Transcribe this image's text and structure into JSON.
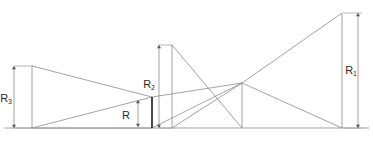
{
  "figure": {
    "kind": "technical-line-diagram",
    "background_color": "#ffffff",
    "line_color": "#8c8c8c",
    "accent_color": "#1a1a1a",
    "dimension_color": "#7d7d7d",
    "text_color": "#2b2b2b",
    "width": 373,
    "height": 141
  },
  "baseline": {
    "label": "baseline",
    "x1": 4,
    "y1": 128,
    "x2": 369,
    "y2": 128
  },
  "nodes": {
    "left_top": {
      "x": 32,
      "y": 66
    },
    "left_bottom": {
      "x": 32,
      "y": 128
    },
    "waist_top": {
      "x": 152,
      "y": 97
    },
    "waist_bottom": {
      "x": 152,
      "y": 128
    },
    "mid_top": {
      "x": 172,
      "y": 45
    },
    "mid_bottom_left": {
      "x": 172,
      "y": 128
    },
    "mid_bottom_right": {
      "x": 242,
      "y": 128
    },
    "crossing": {
      "x": 242,
      "y": 83
    },
    "right_top": {
      "x": 342,
      "y": 13
    },
    "right_bottom": {
      "x": 342,
      "y": 128
    }
  },
  "segments": [
    {
      "name": "left-vertical-edge",
      "x1": 32,
      "y1": 66,
      "x2": 32,
      "y2": 128
    },
    {
      "name": "left-upper-converging-edge",
      "x1": 32,
      "y1": 66,
      "x2": 152,
      "y2": 97
    },
    {
      "name": "left-lower-converging-edge",
      "x1": 32,
      "y1": 128,
      "x2": 152,
      "y2": 97
    },
    {
      "name": "left-base-edge",
      "x1": 32,
      "y1": 128,
      "x2": 152,
      "y2": 128
    },
    {
      "name": "middle-left-vertical-edge",
      "x1": 172,
      "y1": 45,
      "x2": 172,
      "y2": 128
    },
    {
      "name": "middle-apex-to-crossing-base",
      "x1": 172,
      "y1": 45,
      "x2": 242,
      "y2": 128
    },
    {
      "name": "middle-base-to-crossing",
      "x1": 172,
      "y1": 128,
      "x2": 242,
      "y2": 83
    },
    {
      "name": "middle-right-vertical-edge",
      "x1": 242,
      "y1": 83,
      "x2": 242,
      "y2": 128
    },
    {
      "name": "waist-to-crossing-upper",
      "x1": 152,
      "y1": 97,
      "x2": 242,
      "y2": 83
    },
    {
      "name": "waist-to-crossing-lower",
      "x1": 152,
      "y1": 128,
      "x2": 242,
      "y2": 83
    },
    {
      "name": "crossing-to-right-top",
      "x1": 242,
      "y1": 83,
      "x2": 342,
      "y2": 13
    },
    {
      "name": "crossing-to-right-bottom",
      "x1": 242,
      "y1": 83,
      "x2": 342,
      "y2": 128
    },
    {
      "name": "right-vertical-edge",
      "x1": 342,
      "y1": 13,
      "x2": 342,
      "y2": 128
    }
  ],
  "thick_segment": {
    "name": "waist-aperture",
    "x1": 152,
    "y1": 97,
    "x2": 152,
    "y2": 128
  },
  "dimensions": [
    {
      "id": "R3",
      "label": "R",
      "subscript": "3",
      "axis": "vertical",
      "line_x": 14,
      "y_top": 66,
      "y_bottom": 128,
      "label_x": 12,
      "label_y": 99,
      "extension_lines": [
        {
          "x1": 14,
          "y1": 66,
          "x2": 33,
          "y2": 66
        },
        {
          "x1": 14,
          "y1": 128,
          "x2": 33,
          "y2": 128
        }
      ]
    },
    {
      "id": "R",
      "label": "R",
      "subscript": "",
      "axis": "vertical",
      "line_x": 138,
      "y_top": 100,
      "y_bottom": 127,
      "label_x": 130,
      "label_y": 116,
      "extension_lines": []
    },
    {
      "id": "R2",
      "label": "R",
      "subscript": "2",
      "axis": "vertical",
      "line_x": 159,
      "y_top": 45,
      "y_bottom": 128,
      "label_x": 155,
      "label_y": 85,
      "extension_lines": [
        {
          "x1": 159,
          "y1": 45,
          "x2": 173,
          "y2": 45
        },
        {
          "x1": 159,
          "y1": 128,
          "x2": 173,
          "y2": 128
        }
      ]
    },
    {
      "id": "R1",
      "label": "R",
      "subscript": "1",
      "axis": "vertical",
      "line_x": 358,
      "y_top": 13,
      "y_bottom": 128,
      "label_x": 357,
      "label_y": 71,
      "extension_lines": [
        {
          "x1": 343,
          "y1": 13,
          "x2": 362,
          "y2": 13
        },
        {
          "x1": 343,
          "y1": 128,
          "x2": 362,
          "y2": 128
        }
      ]
    }
  ]
}
